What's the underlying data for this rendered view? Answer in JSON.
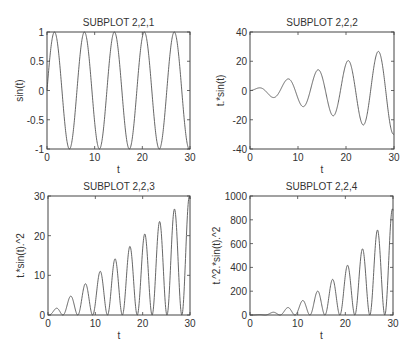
{
  "figure": {
    "width": 417,
    "height": 352,
    "background": "#ffffff",
    "line_color": "#555555",
    "axis_color": "#444444"
  },
  "chart_data": [
    {
      "type": "line",
      "title": "SUBPLOT 2,2,1",
      "xlabel": "t",
      "ylabel": "sin(t)",
      "function": "sin(t)",
      "xlim": [
        0,
        30
      ],
      "ylim": [
        -1,
        1
      ],
      "xticks": [
        0,
        10,
        20,
        30
      ],
      "yticks": [
        -1,
        -0.5,
        0,
        0.5,
        1
      ],
      "ytick_labels": [
        "-1",
        "-0.5",
        "0",
        "0.5",
        "1"
      ],
      "grid": false,
      "box": {
        "left": 47,
        "top": 32,
        "right": 190,
        "bottom": 149
      },
      "series": [
        {
          "name": "sin(t)",
          "x_range": [
            0,
            30
          ],
          "peaks_approx": [
            [
              1.57,
              1
            ],
            [
              7.85,
              1
            ],
            [
              14.14,
              1
            ],
            [
              20.42,
              1
            ],
            [
              26.7,
              1
            ]
          ],
          "troughs_approx": [
            [
              4.71,
              -1
            ],
            [
              10.99,
              -1
            ],
            [
              17.28,
              -1
            ],
            [
              23.56,
              -1
            ],
            [
              29.85,
              -1
            ]
          ]
        }
      ]
    },
    {
      "type": "line",
      "title": "SUBPLOT 2,2,2",
      "xlabel": "t",
      "ylabel": "t.*sin(t)",
      "function": "t*sin(t)",
      "xlim": [
        0,
        30
      ],
      "ylim": [
        -40,
        40
      ],
      "xticks": [
        0,
        10,
        20,
        30
      ],
      "yticks": [
        -40,
        -20,
        0,
        20,
        40
      ],
      "ytick_labels": [
        "-40",
        "-20",
        "0",
        "20",
        "40"
      ],
      "grid": false,
      "box": {
        "left": 250,
        "top": 32,
        "right": 394,
        "bottom": 149
      },
      "series": [
        {
          "name": "t.*sin(t)",
          "x_range": [
            0,
            30
          ],
          "peaks_approx": [
            [
              2.03,
              1.8
            ],
            [
              7.98,
              7.9
            ],
            [
              14.21,
              14.2
            ],
            [
              20.47,
              20.4
            ],
            [
              26.74,
              26.7
            ]
          ],
          "troughs_approx": [
            [
              4.91,
              -4.8
            ],
            [
              11.09,
              -11.0
            ],
            [
              17.34,
              -17.3
            ],
            [
              23.6,
              -23.6
            ],
            [
              29.88,
              -29.9
            ]
          ]
        }
      ]
    },
    {
      "type": "line",
      "title": "SUBPLOT 2,2,3",
      "xlabel": "t",
      "ylabel": "t.*sin(t).^2",
      "function": "t*sin(t)^2",
      "xlim": [
        0,
        30
      ],
      "ylim": [
        0,
        30
      ],
      "xticks": [
        0,
        10,
        20,
        30
      ],
      "yticks": [
        0,
        10,
        20,
        30
      ],
      "ytick_labels": [
        "0",
        "10",
        "20",
        "30"
      ],
      "grid": false,
      "box": {
        "left": 48,
        "top": 196,
        "right": 190,
        "bottom": 315
      },
      "series": [
        {
          "name": "t.*sin(t).^2",
          "x_range": [
            0,
            30
          ],
          "peaks_approx": [
            [
              1.84,
              1.7
            ],
            [
              4.81,
              4.7
            ],
            [
              7.92,
              7.9
            ],
            [
              11.04,
              11.0
            ],
            [
              14.17,
              14.1
            ],
            [
              17.31,
              17.3
            ],
            [
              20.44,
              20.4
            ],
            [
              23.58,
              23.6
            ],
            [
              26.72,
              26.7
            ],
            [
              29.86,
              29.9
            ]
          ]
        }
      ]
    },
    {
      "type": "line",
      "title": "SUBPLOT 2,2,4",
      "xlabel": "t",
      "ylabel": "t.^2.*sin(t).^2",
      "function": "t^2*sin(t)^2",
      "xlim": [
        0,
        30
      ],
      "ylim": [
        0,
        1000
      ],
      "xticks": [
        0,
        10,
        20,
        30
      ],
      "yticks": [
        0,
        200,
        400,
        600,
        800,
        1000
      ],
      "ytick_labels": [
        "0",
        "200",
        "400",
        "600",
        "800",
        "1000"
      ],
      "grid": false,
      "box": {
        "left": 250,
        "top": 196,
        "right": 393,
        "bottom": 315
      },
      "series": [
        {
          "name": "t.^2.*sin(t).^2",
          "x_range": [
            0,
            30
          ],
          "peaks_approx": [
            [
              2.03,
              3.3
            ],
            [
              4.91,
              23.7
            ],
            [
              7.98,
              63.7
            ],
            [
              11.09,
              122.9
            ],
            [
              14.21,
              201.8
            ],
            [
              17.34,
              300.6
            ],
            [
              20.47,
              419.4
            ],
            [
              23.6,
              558.2
            ],
            [
              26.74,
              716.8
            ],
            [
              29.88,
              893.2
            ]
          ]
        }
      ]
    }
  ]
}
